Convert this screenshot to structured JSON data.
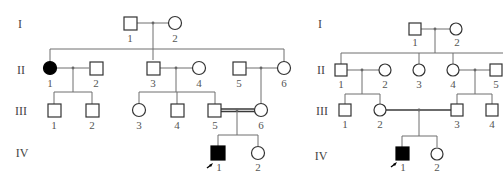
{
  "figure": {
    "pedigrees": [
      {
        "id": "left",
        "generations": [
          "I",
          "II",
          "III",
          "IV"
        ],
        "individuals": [
          {
            "gen": "I",
            "n": "1",
            "sex": "male",
            "affected": false
          },
          {
            "gen": "I",
            "n": "2",
            "sex": "female",
            "affected": false
          },
          {
            "gen": "II",
            "n": "1",
            "sex": "female",
            "affected": true
          },
          {
            "gen": "II",
            "n": "2",
            "sex": "male",
            "affected": false
          },
          {
            "gen": "II",
            "n": "3",
            "sex": "male",
            "affected": false
          },
          {
            "gen": "II",
            "n": "4",
            "sex": "female",
            "affected": false
          },
          {
            "gen": "II",
            "n": "5",
            "sex": "male",
            "affected": false
          },
          {
            "gen": "II",
            "n": "6",
            "sex": "female",
            "affected": false
          },
          {
            "gen": "III",
            "n": "1",
            "sex": "male",
            "affected": false
          },
          {
            "gen": "III",
            "n": "2",
            "sex": "male",
            "affected": false
          },
          {
            "gen": "III",
            "n": "3",
            "sex": "female",
            "affected": false
          },
          {
            "gen": "III",
            "n": "4",
            "sex": "male",
            "affected": false
          },
          {
            "gen": "III",
            "n": "5",
            "sex": "male",
            "affected": false
          },
          {
            "gen": "III",
            "n": "6",
            "sex": "female",
            "affected": false
          },
          {
            "gen": "IV",
            "n": "1",
            "sex": "male",
            "affected": true,
            "proband": true
          },
          {
            "gen": "IV",
            "n": "2",
            "sex": "female",
            "affected": false
          }
        ],
        "consanguineous_couple": "III-5 x III-6"
      },
      {
        "id": "right",
        "generations": [
          "I",
          "II",
          "III",
          "IV"
        ],
        "individuals": [
          {
            "gen": "I",
            "n": "1",
            "sex": "male",
            "affected": false
          },
          {
            "gen": "I",
            "n": "2",
            "sex": "female",
            "affected": false
          },
          {
            "gen": "II",
            "n": "1",
            "sex": "male",
            "affected": false
          },
          {
            "gen": "II",
            "n": "2",
            "sex": "female",
            "affected": false
          },
          {
            "gen": "II",
            "n": "3",
            "sex": "female",
            "affected": false
          },
          {
            "gen": "II",
            "n": "4",
            "sex": "female",
            "affected": false
          },
          {
            "gen": "II",
            "n": "5",
            "sex": "male",
            "affected": false
          },
          {
            "gen": "III",
            "n": "1",
            "sex": "male",
            "affected": false
          },
          {
            "gen": "III",
            "n": "2",
            "sex": "female",
            "affected": false
          },
          {
            "gen": "III",
            "n": "3",
            "sex": "male",
            "affected": false
          },
          {
            "gen": "III",
            "n": "4",
            "sex": "male",
            "affected": false
          },
          {
            "gen": "IV",
            "n": "1",
            "sex": "male",
            "affected": true,
            "proband": true
          },
          {
            "gen": "IV",
            "n": "2",
            "sex": "female",
            "affected": false
          }
        ],
        "consanguineous_couple": "III-2 x III-3"
      }
    ]
  },
  "labels": {
    "gen_I": "I",
    "gen_II": "II",
    "gen_III": "III",
    "gen_IV": "IV",
    "n1": "1",
    "n2": "2",
    "n3": "3",
    "n4": "4",
    "n5": "5",
    "n6": "6"
  },
  "colors": {
    "affected": "#000000",
    "unaffected": "#ffffff",
    "line": "#6e6e6e"
  }
}
